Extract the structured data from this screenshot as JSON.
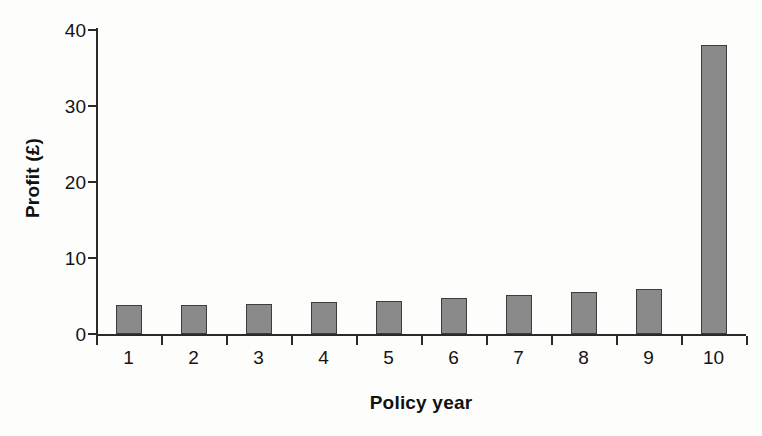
{
  "chart_data": {
    "type": "bar",
    "title": "",
    "subtitle": "",
    "xlabel": "Policy year",
    "ylabel": "Profit (£)",
    "categories": [
      "1",
      "2",
      "3",
      "4",
      "5",
      "6",
      "7",
      "8",
      "9",
      "10"
    ],
    "values": [
      3.8,
      3.8,
      4.0,
      4.2,
      4.4,
      4.8,
      5.1,
      5.5,
      5.9,
      38.0
    ],
    "ylim": [
      0,
      40
    ],
    "yticks": [
      0,
      10,
      20,
      30,
      40
    ],
    "ytick_labels": [
      "0",
      "10",
      "20",
      "30",
      "40"
    ],
    "grid": false,
    "legend": null,
    "legend_position": "none",
    "series": [
      {
        "name": "Profit",
        "values": [
          3.8,
          3.8,
          4.0,
          4.2,
          4.4,
          4.8,
          5.1,
          5.5,
          5.9,
          38.0
        ]
      }
    ],
    "annotations": [],
    "colors": {
      "bar_fill": "#8a8a8a",
      "bar_edge": "#3d3d3d",
      "axis": "#2a2a2a",
      "text": "#141414",
      "background": "#fdfdfc"
    }
  }
}
